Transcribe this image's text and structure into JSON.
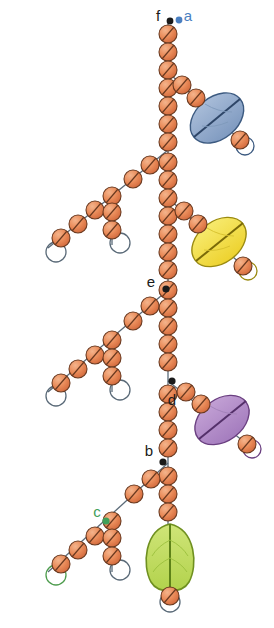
{
  "figure": {
    "background_color": "#ffffff",
    "width": 274,
    "height": 628
  },
  "palette": {
    "bead_fill": "#E07C4E",
    "bead_fill_light": "#F0A878",
    "bead_stroke": "#6B3A20",
    "stem_line": "#5A6A78",
    "pod_blue_fill": "#8FA8C8",
    "pod_blue_stroke": "#3C5A80",
    "pod_yellow_fill": "#F2E04A",
    "pod_yellow_stroke": "#9A8A10",
    "pod_purple_fill": "#B28CC8",
    "pod_purple_stroke": "#6A3F80",
    "pod_green_fill": "#C2DC5E",
    "pod_green_stroke": "#6F9020",
    "label_black": "#1A1A1A",
    "label_blue": "#4A7FC1",
    "label_green": "#3FA05A",
    "branch_green_outline": "#4E9C4E",
    "branch_grey_outline": "#5A6A78"
  },
  "labels": [
    {
      "id": "f",
      "text": "f",
      "x": 158,
      "y": 17,
      "color": "#1A1A1A",
      "dot_x": 170,
      "dot_y": 21,
      "dot_color": "#1A1A1A"
    },
    {
      "id": "a",
      "text": "a",
      "x": 188,
      "y": 17,
      "color": "#4A7FC1",
      "dot_x": 179,
      "dot_y": 20,
      "dot_color": "#4A7FC1"
    },
    {
      "id": "e",
      "text": "e",
      "x": 151,
      "y": 283,
      "color": "#1A1A1A",
      "dot_x": 166,
      "dot_y": 289,
      "dot_color": "#1A1A1A"
    },
    {
      "id": "d",
      "text": "d",
      "x": 172,
      "y": 401,
      "color": "#1A1A1A",
      "dot_x": 172,
      "dot_y": 381,
      "dot_color": "#1A1A1A"
    },
    {
      "id": "b",
      "text": "b",
      "x": 149,
      "y": 452,
      "color": "#1A1A1A",
      "dot_x": 163,
      "dot_y": 462,
      "dot_color": "#1A1A1A"
    },
    {
      "id": "c",
      "text": "c",
      "x": 97,
      "y": 513,
      "color": "#3FA05A",
      "dot_x": 106,
      "dot_y": 521,
      "dot_color": "#3FA05A"
    }
  ],
  "pods": [
    {
      "id": "pod-blue",
      "color_name": "blue",
      "fill": "#8FA8C8",
      "stroke": "#3C5A80",
      "cx": 217,
      "cy": 118,
      "rx": 24,
      "ry": 17,
      "rotation": -40,
      "has_midline": true
    },
    {
      "id": "pod-yellow",
      "color_name": "yellow",
      "fill": "#F2E04A",
      "stroke": "#9A8A10",
      "cx": 219,
      "cy": 242,
      "rx": 24,
      "ry": 17,
      "rotation": -35,
      "has_midline": true
    },
    {
      "id": "pod-purple",
      "color_name": "purple",
      "fill": "#B28CC8",
      "stroke": "#6A3F80",
      "cx": 222,
      "cy": 420,
      "rx": 24,
      "ry": 17,
      "rotation": -35,
      "has_midline": true
    },
    {
      "id": "pod-green",
      "color_name": "green",
      "fill": "#C2DC5E",
      "stroke": "#6F9020",
      "cx": 170,
      "cy": 558,
      "rx": 22,
      "ry": 28,
      "rotation": 0,
      "has_midline": true
    }
  ],
  "structure": {
    "main_stem_label": "central vertical bead chain",
    "branch_count": 10,
    "bead_count_total": 92,
    "terminal_loop_count": 7
  }
}
